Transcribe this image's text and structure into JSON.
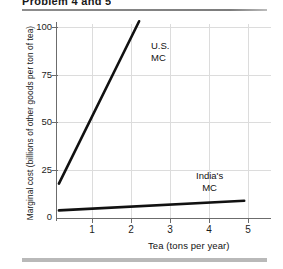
{
  "figure": {
    "title": "Problem 4 and 5",
    "us_label": "U.S.\nMC",
    "india_label": "India's\nMC"
  },
  "chart_data": {
    "type": "line",
    "title": "Problem 4 and 5",
    "xlabel": "Tea (tons per year)",
    "ylabel": "Marginal cost (billions of other goods per ton of tea)",
    "xlim": [
      0,
      5.5
    ],
    "ylim": [
      0,
      110
    ],
    "xticks": [
      1,
      2,
      3,
      4,
      5
    ],
    "yticks": [
      0,
      25,
      50,
      75,
      100
    ],
    "grid": true,
    "legend_position": "inline-annotations",
    "series": [
      {
        "name": "U.S. MC",
        "label": "U.S.\nMC",
        "color": "#111111",
        "x": [
          0.05,
          2.15
        ],
        "y": [
          18,
          103
        ]
      },
      {
        "name": "India's MC",
        "label": "India's\nMC",
        "color": "#111111",
        "x": [
          0.05,
          4.9
        ],
        "y": [
          4,
          9
        ]
      }
    ]
  },
  "axes": {
    "y_tick_labels": [
      "100",
      "75",
      "50",
      "25",
      "0"
    ],
    "x_tick_labels": [
      "1",
      "2",
      "3",
      "4",
      "5"
    ]
  }
}
